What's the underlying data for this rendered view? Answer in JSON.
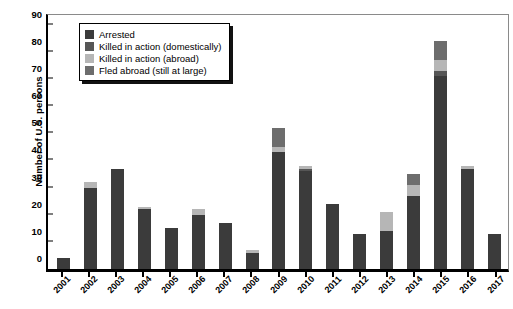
{
  "chart_data": {
    "type": "bar",
    "stacked": true,
    "title": "",
    "xlabel": "",
    "ylabel": "Number of U.S. persons",
    "ylim": [
      0,
      95
    ],
    "yticks": [
      0,
      10,
      20,
      30,
      40,
      50,
      60,
      70,
      80,
      90
    ],
    "grid": false,
    "legend_position": "upper-left",
    "categories": [
      "2001",
      "2002",
      "2003",
      "2004",
      "2005",
      "2006",
      "2007",
      "2008",
      "2009",
      "2010",
      "2011",
      "2012",
      "2013",
      "2014",
      "2015",
      "2016",
      "2017"
    ],
    "series": [
      {
        "name": "Arrested",
        "color": "#3b3b3b",
        "values": [
          4,
          30,
          37,
          22,
          15,
          20,
          17,
          6,
          43,
          36,
          24,
          13,
          14,
          27,
          71,
          37,
          13
        ]
      },
      {
        "name": "Killed in action (domestically)",
        "color": "#565656",
        "values": [
          0,
          0,
          0,
          0,
          0,
          0,
          0,
          0,
          0,
          1,
          0,
          0,
          0,
          0,
          2,
          0,
          0
        ]
      },
      {
        "name": "Killed in action (abroad)",
        "color": "#b6b6b6",
        "values": [
          0,
          2,
          0,
          1,
          0,
          2,
          0,
          1,
          2,
          1,
          0,
          0,
          7,
          4,
          4,
          1,
          0
        ]
      },
      {
        "name": "Fled abroad (still at large)",
        "color": "#6d6d6d",
        "values": [
          0,
          0,
          0,
          0,
          0,
          0,
          0,
          0,
          7,
          0,
          0,
          0,
          0,
          4,
          7,
          0,
          0
        ]
      }
    ],
    "totals": [
      4,
      32,
      37,
      23,
      15,
      22,
      17,
      7,
      52,
      38,
      24,
      13,
      21,
      35,
      84,
      38,
      13
    ]
  },
  "legend": {
    "items": [
      {
        "label": "Arrested",
        "color": "#3b3b3b"
      },
      {
        "label": "Killed in action (domestically)",
        "color": "#565656"
      },
      {
        "label": "Killed in action (abroad)",
        "color": "#b6b6b6"
      },
      {
        "label": "Fled abroad (still at large)",
        "color": "#6d6d6d"
      }
    ]
  },
  "axes": {
    "y_title": "Number of U.S. persons"
  }
}
